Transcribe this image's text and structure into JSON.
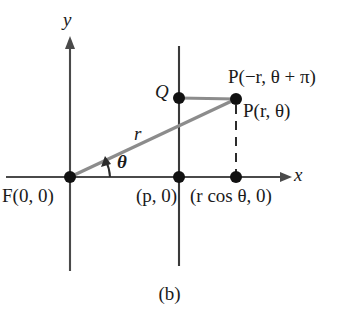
{
  "figure": {
    "caption": "(b)",
    "axes": {
      "x_label": "x",
      "y_label": "y"
    },
    "labels": {
      "focus": "F(0, 0)",
      "p_point": "(p, 0)",
      "rcos_point": "(r cos θ, 0)",
      "q_point": "Q",
      "p_negative_r": "P(−r, θ + π)",
      "p_r_theta": "P(r, θ)",
      "radius": "r",
      "theta": "θ"
    },
    "colors": {
      "axis": "#4a4a4a",
      "directrix": "#3a3a3a",
      "ray": "#8c8c8c",
      "segment_qp": "#8c8c8c",
      "dashed_drop": "#2b2b2b",
      "point_fill": "#111111",
      "text": "#1a1a1a",
      "background": "#ffffff"
    },
    "geometry": {
      "origin": {
        "x": 70,
        "y": 177
      },
      "directrix_x": 179,
      "point_p": {
        "x": 236,
        "y": 99
      },
      "point_q": {
        "x": 179,
        "y": 98
      },
      "foot_rcos": {
        "x": 236,
        "y": 177
      },
      "x_axis": {
        "x1": 6,
        "x2": 292,
        "y": 177
      },
      "y_axis": {
        "x": 70,
        "y1": 37,
        "y2": 271
      },
      "directrix_span": {
        "y1": 46,
        "y2": 266
      }
    }
  }
}
